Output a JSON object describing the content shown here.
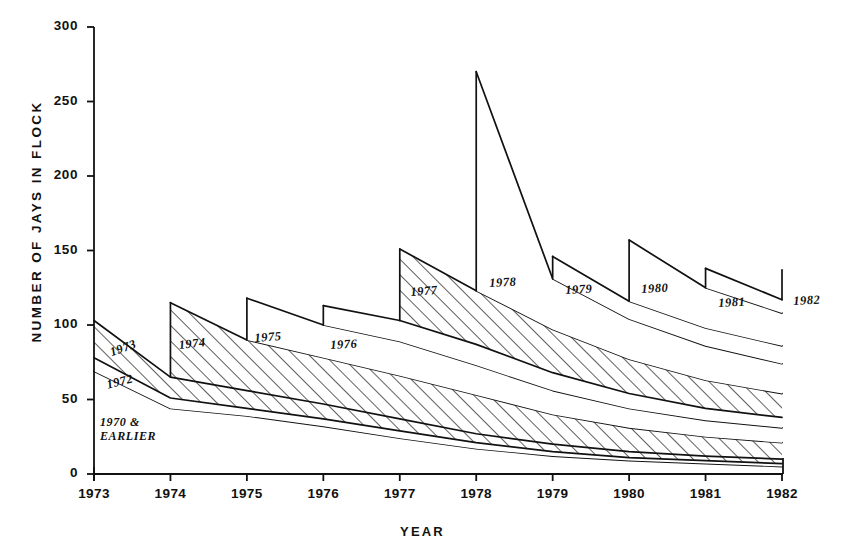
{
  "chart_data": {
    "type": "area",
    "title": "",
    "xlabel": "YEAR",
    "ylabel": "NUMBER OF JAYS IN FLOCK",
    "xlim": [
      1973,
      1982
    ],
    "ylim": [
      0,
      300
    ],
    "ytick_labels": [
      "300",
      "250",
      "200",
      "150",
      "100",
      "50",
      "0"
    ],
    "ytick_values": [
      300,
      250,
      200,
      150,
      100,
      50,
      0
    ],
    "xtick_labels": [
      "1973",
      "1974",
      "1975",
      "1976",
      "1977",
      "1978",
      "1979",
      "1980",
      "1981",
      "1982"
    ],
    "xtick_values": [
      1973,
      1974,
      1975,
      1976,
      1977,
      1978,
      1979,
      1980,
      1981,
      1982
    ],
    "grid": false,
    "legend": "inline-cohort-labels",
    "stacked": true,
    "note": "Stacked cohort survivorship: each cohort enters with a vertical jump in its hatch year, then the whole stack decays. Values are cumulative flock totals (top edge of each cohort band).",
    "series": [
      {
        "name": "1970 & EARLIER",
        "label": "1970 &\nEARLIER",
        "hatched": false,
        "x": [
          1973,
          1974,
          1975,
          1976,
          1977,
          1978,
          1979,
          1980,
          1981,
          1982
        ],
        "cumulative": [
          69,
          44,
          39,
          32,
          24,
          17,
          12,
          9,
          7,
          5
        ]
      },
      {
        "name": "1972",
        "label": "1972",
        "hatched": false,
        "x": [
          1973,
          1974,
          1975,
          1976,
          1977,
          1978,
          1979,
          1980,
          1981,
          1982
        ],
        "cumulative": [
          78,
          51,
          44,
          37,
          29,
          21,
          15,
          11,
          9,
          7
        ]
      },
      {
        "name": "1973",
        "label": "1973",
        "hatched": true,
        "x": [
          1973,
          1974,
          1975,
          1976,
          1977,
          1978,
          1979,
          1980,
          1981,
          1982
        ],
        "cumulative": [
          103,
          65,
          56,
          47,
          37,
          27,
          20,
          15,
          12,
          10
        ]
      },
      {
        "name": "1974",
        "label": "1974",
        "hatched": true,
        "enters": 1974,
        "x": [
          1974,
          1975,
          1976,
          1977,
          1978,
          1979,
          1980,
          1981,
          1982
        ],
        "cumulative": [
          115,
          90,
          78,
          66,
          53,
          40,
          31,
          25,
          21
        ]
      },
      {
        "name": "1975",
        "label": "1975",
        "hatched": false,
        "enters": 1975,
        "x": [
          1975,
          1976,
          1977,
          1978,
          1979,
          1980,
          1981,
          1982
        ],
        "cumulative": [
          118,
          100,
          89,
          73,
          56,
          44,
          36,
          31
        ]
      },
      {
        "name": "1976",
        "label": "1976",
        "hatched": false,
        "enters": 1976,
        "x": [
          1976,
          1977,
          1978,
          1979,
          1980,
          1981,
          1982
        ],
        "cumulative": [
          113,
          103,
          87,
          68,
          54,
          44,
          38
        ]
      },
      {
        "name": "1977",
        "label": "1977",
        "hatched": true,
        "enters": 1977,
        "x": [
          1977,
          1978,
          1979,
          1980,
          1981,
          1982
        ],
        "cumulative": [
          151,
          123,
          97,
          77,
          63,
          54
        ]
      },
      {
        "name": "1978",
        "label": "1978",
        "hatched": false,
        "enters": 1978,
        "x": [
          1978,
          1979,
          1980,
          1981,
          1982
        ],
        "cumulative": [
          270,
          131,
          104,
          86,
          74
        ]
      },
      {
        "name": "1979",
        "label": "1979",
        "hatched": false,
        "enters": 1979,
        "x": [
          1979,
          1980,
          1981,
          1982
        ],
        "cumulative": [
          146,
          116,
          98,
          86
        ]
      },
      {
        "name": "1980",
        "label": "1980",
        "hatched": false,
        "enters": 1980,
        "x": [
          1980,
          1981,
          1982
        ],
        "cumulative": [
          157,
          125,
          108
        ]
      },
      {
        "name": "1981",
        "label": "1981",
        "hatched": false,
        "enters": 1981,
        "x": [
          1981,
          1982
        ],
        "cumulative": [
          138,
          117
        ]
      },
      {
        "name": "1982",
        "label": "1982",
        "hatched": false,
        "enters": 1982,
        "x": [
          1982
        ],
        "cumulative": [
          137
        ]
      }
    ],
    "cohort_label_positions": [
      {
        "name": "1973",
        "label": "1973",
        "x": 108,
        "y": 346,
        "rotate": -20
      },
      {
        "name": "1972",
        "label": "1972",
        "x": 105,
        "y": 378,
        "rotate": -14
      },
      {
        "name": "1970-earlier",
        "label": "1970 &\nEARLIER",
        "x": 100,
        "y": 415,
        "rotate": 0
      },
      {
        "name": "1974",
        "label": "1974",
        "x": 178,
        "y": 338,
        "rotate": -6
      },
      {
        "name": "1975",
        "label": "1975",
        "x": 254,
        "y": 331,
        "rotate": -4
      },
      {
        "name": "1976",
        "label": "1976",
        "x": 330,
        "y": 338,
        "rotate": -3
      },
      {
        "name": "1977",
        "label": "1977",
        "x": 410,
        "y": 285,
        "rotate": -4
      },
      {
        "name": "1978",
        "label": "1978",
        "x": 489,
        "y": 276,
        "rotate": -3
      },
      {
        "name": "1979",
        "label": "1979",
        "x": 565,
        "y": 283,
        "rotate": -3
      },
      {
        "name": "1980",
        "label": "1980",
        "x": 641,
        "y": 282,
        "rotate": -3
      },
      {
        "name": "1981",
        "label": "1981",
        "x": 718,
        "y": 296,
        "rotate": -3
      },
      {
        "name": "1982",
        "label": "1982",
        "x": 793,
        "y": 294,
        "rotate": -3
      }
    ]
  },
  "axes": {
    "ylabel_text": "NUMBER OF JAYS IN FLOCK",
    "xlabel_text": "YEAR"
  },
  "style": {
    "line_color": "#111111",
    "background": "#ffffff",
    "hatch_color": "#111111"
  }
}
